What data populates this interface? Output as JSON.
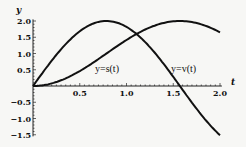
{
  "chart_data": {
    "type": "line",
    "title": "",
    "xlabel": "t",
    "ylabel": "y",
    "xlim": [
      0,
      2.0
    ],
    "ylim": [
      -1.5,
      2.0
    ],
    "x_ticks": [
      "0.5",
      "1.0",
      "1.5",
      "2.0"
    ],
    "y_ticks": [
      "2.0",
      "1.5",
      "1.0",
      "0.5",
      "-0.5",
      "-1.0",
      "-1.5"
    ],
    "grid": false,
    "legend": "none (curves labeled inline)",
    "series": [
      {
        "name": "y=s(t)",
        "x": [
          0,
          0.25,
          0.5,
          0.75,
          1.0,
          1.25,
          1.5,
          1.75,
          2.0
        ],
        "values": [
          0,
          0.12,
          0.46,
          0.93,
          1.42,
          1.8,
          1.99,
          1.94,
          1.65
        ]
      },
      {
        "name": "y=v(t)",
        "x": [
          0,
          0.25,
          0.5,
          0.75,
          1.0,
          1.25,
          1.5,
          1.75,
          2.0
        ],
        "values": [
          0,
          0.96,
          1.68,
          1.99,
          1.82,
          1.2,
          0.28,
          -0.7,
          -1.51
        ]
      }
    ],
    "annotations": [
      "y=s(t)",
      "y=v(t)"
    ]
  },
  "labels": {
    "x_axis": "t",
    "y_axis": "y",
    "s_curve": "y=s(t)",
    "v_curve": "y=v(t)",
    "xt": [
      "0.5",
      "1.0",
      "1.5",
      "2.0"
    ],
    "yt": [
      "2.0",
      "1.5",
      "1.0",
      "0.5",
      "−0.5",
      "−1.0",
      "−1.5"
    ]
  }
}
